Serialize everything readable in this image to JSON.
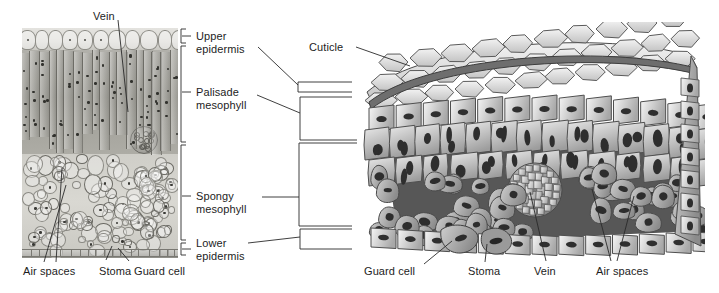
{
  "figure": {
    "type": "biology-diagram"
  },
  "micrograph": {
    "name": "leaf-cross-section-micrograph",
    "labels": {
      "vein": "Vein",
      "air_spaces": "Air spaces",
      "stoma": "Stoma",
      "guard_cell": "Guard cell"
    }
  },
  "center_labels": {
    "upper_epidermis_line1": "Upper",
    "upper_epidermis_line2": "epidermis",
    "palisade_line1": "Palisade",
    "palisade_line2": "mesophyll",
    "spongy_line1": "Spongy",
    "spongy_line2": "mesophyll",
    "lower_epidermis_line1": "Lower",
    "lower_epidermis_line2": "epidermis"
  },
  "block_diagram": {
    "name": "leaf-3d-block-diagram",
    "labels": {
      "cuticle": "Cuticle",
      "guard_cell": "Guard cell",
      "stoma": "Stoma",
      "vein": "Vein",
      "air_spaces": "Air spaces"
    }
  },
  "colors": {
    "text": "#1d1d1d",
    "line": "#2a2a2a",
    "cell_fill_light": "#e2e2e2",
    "cell_fill_mid": "#bcbcbc",
    "cell_fill_dark": "#8f8f8f",
    "cell_stroke": "#4a4a4a",
    "cuticle": "#6a6a6a",
    "background": "#ffffff"
  }
}
